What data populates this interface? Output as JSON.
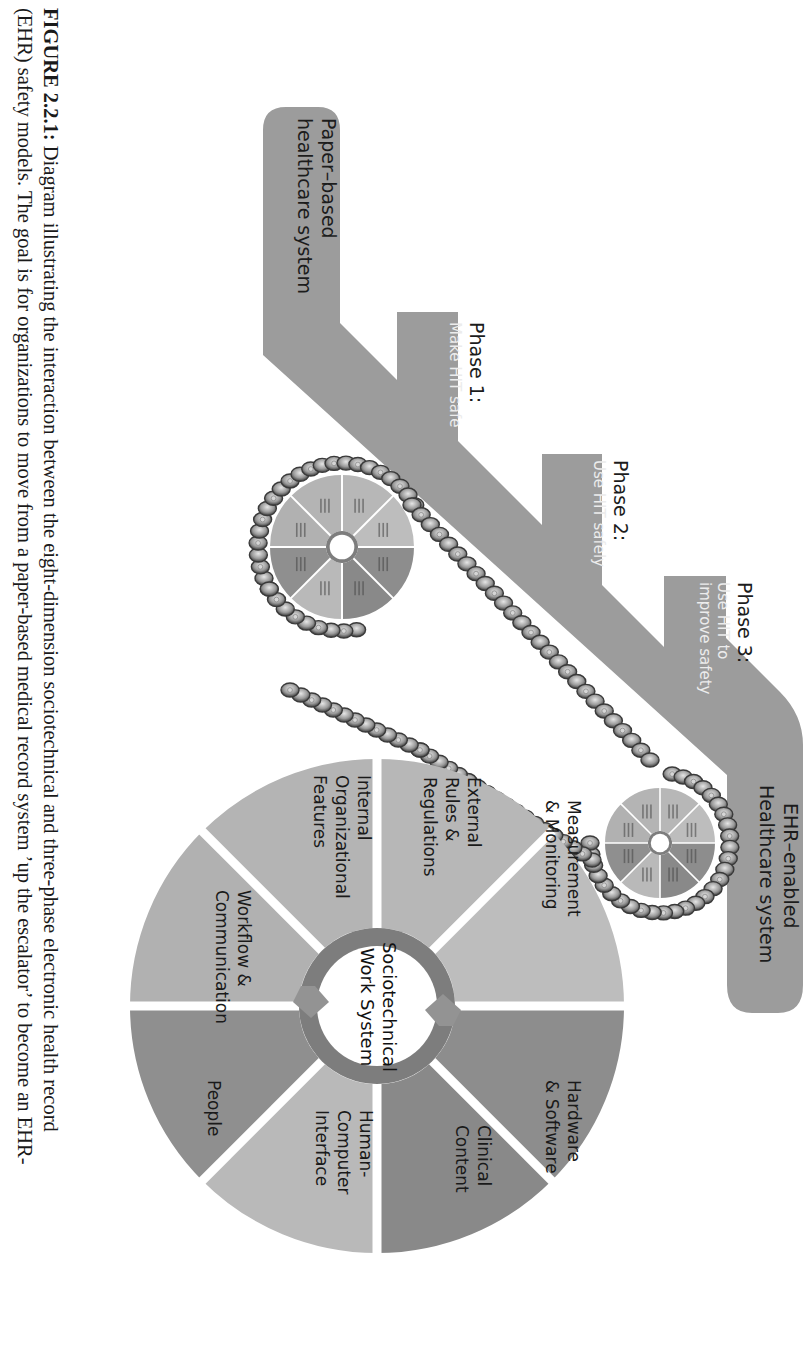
{
  "caption": {
    "figure_label": "FIGURE 2.2.1:",
    "line1_rest": " Diagram illustrating the interaction between the eight-dimension sociotechnical and three-phase electronic health record",
    "line2": "(EHR) safety models. The goal is for organizations to move from a paper-based medical record system ’up the escalator’ to become an EHR-"
  },
  "diagram": {
    "start_box": {
      "line1": "Paper–based",
      "line2": "healthcare system"
    },
    "end_box": {
      "line1": "EHR–enabled",
      "line2": "Healthcare system"
    },
    "phases": [
      {
        "title": "Phase 1:",
        "subtitle_lines": [
          "Make HIT safe"
        ]
      },
      {
        "title": "Phase 2:",
        "subtitle_lines": [
          "Use HIT safely"
        ]
      },
      {
        "title": "Phase 3:",
        "subtitle_lines": [
          "Use HIT to",
          "improve safety"
        ]
      }
    ],
    "wheel": {
      "center_lines": [
        "Sociotechnical",
        "Work System"
      ],
      "sectors": [
        {
          "lines": [
            "External",
            "Rules &",
            "Regulations"
          ],
          "color": "#b7b7b7"
        },
        {
          "lines": [
            "Measurement",
            "& Monitoring"
          ],
          "color": "#bdbdbd"
        },
        {
          "lines": [
            "Hardware",
            "& Software"
          ],
          "color": "#8d8d8d"
        },
        {
          "lines": [
            "Clinical",
            "Content"
          ],
          "color": "#898989"
        },
        {
          "lines": [
            "Human-",
            "Computer",
            "Interface"
          ],
          "color": "#b9b9b9"
        },
        {
          "lines": [
            "People"
          ],
          "color": "#8f8f8f"
        },
        {
          "lines": [
            "Workflow &",
            "Communication"
          ],
          "color": "#b1b1b1"
        },
        {
          "lines": [
            "Internal",
            "Organizational",
            "Features"
          ],
          "color": "#b4b4b4"
        }
      ]
    },
    "colors": {
      "band": "#9c9c9c",
      "ring": "#7d7d7d",
      "divider": "#ffffff",
      "chain_dark": "#3a3a3a",
      "chain_mid": "#8a8a8a",
      "chain_light": "#d6d6d6"
    }
  }
}
